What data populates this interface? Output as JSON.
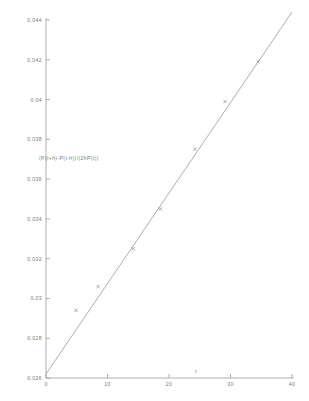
{
  "chart_data": {
    "type": "scatter",
    "title": "",
    "subtitle": "",
    "xlabel": "t",
    "ylabel": "(P(t+h)-P(t-h))/(2hP(t))",
    "xlim": [
      0,
      40
    ],
    "ylim": [
      0.026,
      0.044
    ],
    "grid": false,
    "legend": null,
    "xticks": [
      "0",
      "10",
      "20",
      "30",
      "40"
    ],
    "xtick_values": [
      0,
      10,
      20,
      30,
      40
    ],
    "yticks": [
      "0.026",
      "0.028",
      "0.03",
      "0.032",
      "0.034",
      "0.036",
      "0.038",
      "0.04",
      "0.042",
      "0.044"
    ],
    "ytick_values": [
      0.026,
      0.028,
      0.03,
      0.032,
      0.034,
      0.036,
      0.038,
      0.04,
      0.042,
      0.044
    ],
    "series": [
      {
        "name": "data points",
        "marker": "x",
        "type": "scatter",
        "color": "#8a8a8a",
        "x": [
          4.9,
          8.5,
          14.2,
          18.6,
          24.2,
          29.1,
          34.5
        ],
        "y": [
          0.0294,
          0.0306,
          0.0325,
          0.0345,
          0.0375,
          0.0399,
          0.0419
        ]
      },
      {
        "name": "fitted line",
        "type": "line",
        "color": "#8a8a8a",
        "x": [
          0,
          40
        ],
        "y": [
          0.0262,
          0.0444
        ]
      }
    ],
    "annotations": []
  },
  "axes": {
    "y_caption": "(P(t+h)-P(t-h))/(2hP(t))",
    "x_caption": "t"
  }
}
